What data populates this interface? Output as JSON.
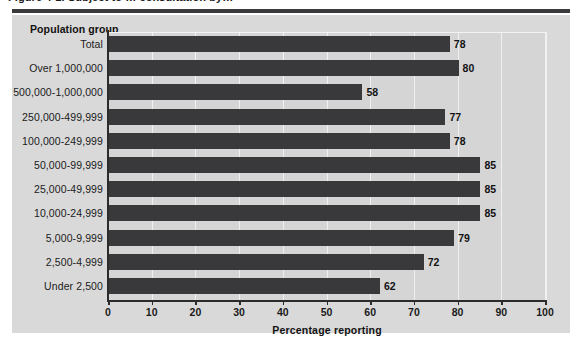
{
  "figure": {
    "caption_partial": "Figure 4-1.  Subject to … consultation by…",
    "panel_header": "Population group"
  },
  "chart_data": {
    "type": "bar",
    "orientation": "horizontal",
    "title": "",
    "xlabel": "Percentage reporting",
    "ylabel": "Population group",
    "xlim": [
      0,
      100
    ],
    "xticks": [
      0,
      10,
      20,
      30,
      40,
      50,
      60,
      70,
      80,
      90,
      100
    ],
    "xtick_labels": [
      "0",
      "10",
      "20",
      "30",
      "40",
      "50",
      "60",
      "70",
      "80",
      "90",
      "100"
    ],
    "grid": "vertical",
    "legend": "none",
    "bar_color": "#39393b",
    "plot_background": "#d5d5d5",
    "panel_background": "#d9d9d9",
    "categories": [
      "Total",
      "Over 1,000,000",
      "500,000-1,000,000",
      "250,000-499,999",
      "100,000-249,999",
      "50,000-99,999",
      "25,000-49,999",
      "10,000-24,999",
      "5,000-9,999",
      "2,500-4,999",
      "Under 2,500"
    ],
    "values": [
      78,
      80,
      58,
      77,
      78,
      85,
      85,
      85,
      79,
      72,
      62
    ],
    "value_labels": [
      "78",
      "80",
      "58",
      "77",
      "78",
      "85",
      "85",
      "85",
      "79",
      "72",
      "62"
    ]
  }
}
